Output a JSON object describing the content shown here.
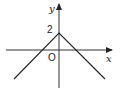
{
  "graph": {
    "function": "y = -|x| + 2",
    "x_axis_label": "x",
    "y_axis_label": "y",
    "origin_label": "O",
    "y_intercept_label": "2",
    "vertex": [
      0,
      2
    ],
    "x_intercepts": [
      -2,
      2
    ],
    "line_color": "#222222"
  }
}
